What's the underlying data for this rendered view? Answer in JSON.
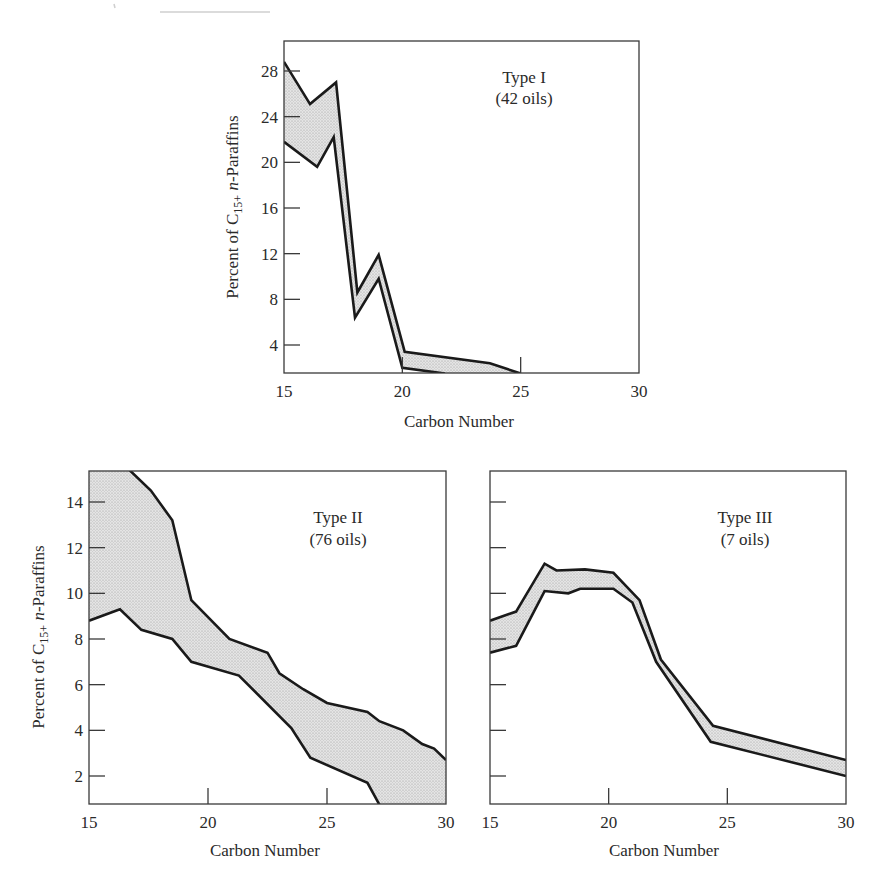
{
  "figure": {
    "panels": [
      {
        "id": "type-1",
        "type_label": "Type I",
        "count_label": "(42 oils)",
        "xlabel": "Carbon Number",
        "ylabel_prefix": "Percent of C",
        "ylabel_subscript": "15+",
        "ylabel_italic": "n",
        "ylabel_suffix": "-Paraffins",
        "x_ticks": [
          "15",
          "20",
          "25",
          "30"
        ],
        "y_ticks": [
          "4",
          "8",
          "12",
          "16",
          "20",
          "24",
          "28"
        ]
      },
      {
        "id": "type-2",
        "type_label": "Type II",
        "count_label": "(76 oils)",
        "xlabel": "Carbon Number",
        "ylabel_prefix": "Percent of C",
        "ylabel_subscript": "15+",
        "ylabel_italic": "n",
        "ylabel_suffix": "-Paraffins",
        "x_ticks": [
          "15",
          "20",
          "25",
          "30"
        ],
        "y_ticks": [
          "2",
          "4",
          "6",
          "8",
          "10",
          "12",
          "14"
        ]
      },
      {
        "id": "type-3",
        "type_label": "Type III",
        "count_label": "(7 oils)",
        "xlabel": "Carbon Number",
        "x_ticks": [
          "15",
          "20",
          "25",
          "30"
        ],
        "y_ticks": []
      }
    ]
  },
  "chart_data": [
    {
      "type": "area",
      "title": "Type I (42 oils)",
      "xlabel": "Carbon Number",
      "ylabel": "Percent of C15+ n-Paraffins",
      "xlim": [
        15,
        30
      ],
      "ylim": [
        1.5,
        30.5
      ],
      "x_ticks": [
        15,
        20,
        25,
        30
      ],
      "y_ticks": [
        4,
        8,
        12,
        16,
        20,
        24,
        28
      ],
      "grid": false,
      "series": [
        {
          "name": "upper bound",
          "x": [
            15,
            16.1,
            17.2,
            18.1,
            19.0,
            20.1,
            23.7,
            25.0
          ],
          "values": [
            28.8,
            25.1,
            27.0,
            8.6,
            11.9,
            3.4,
            2.4,
            1.5
          ]
        },
        {
          "name": "lower bound",
          "x": [
            15,
            16.4,
            17.1,
            18.0,
            19.0,
            20.0,
            21.8
          ],
          "values": [
            21.8,
            19.6,
            22.2,
            6.4,
            9.8,
            2.0,
            1.5
          ]
        }
      ],
      "annotations": [
        "Type I",
        "(42 oils)"
      ]
    },
    {
      "type": "area",
      "title": "Type II (76 oils)",
      "xlabel": "Carbon Number",
      "ylabel": "Percent of C15+ n-Paraffins",
      "xlim": [
        15,
        30
      ],
      "ylim": [
        0.75,
        15.4
      ],
      "x_ticks": [
        15,
        20,
        25,
        30
      ],
      "y_ticks": [
        2,
        4,
        6,
        8,
        10,
        12,
        14
      ],
      "grid": false,
      "series": [
        {
          "name": "upper bound",
          "x": [
            15,
            16.7,
            17.6,
            18.5,
            19.3,
            20.9,
            22.5,
            23.0,
            24.0,
            25.0,
            26.7,
            27.2,
            28.2,
            29.0,
            29.5,
            30.0
          ],
          "values": [
            15.4,
            15.4,
            14.5,
            13.2,
            9.7,
            8.0,
            7.4,
            6.5,
            5.8,
            5.2,
            4.8,
            4.4,
            4.0,
            3.4,
            3.2,
            2.7
          ]
        },
        {
          "name": "lower bound",
          "x": [
            15,
            16.3,
            17.2,
            18.5,
            19.3,
            21.3,
            23.5,
            24.3,
            26.7,
            27.2
          ],
          "values": [
            8.8,
            9.3,
            8.4,
            8.0,
            7.0,
            6.4,
            4.1,
            2.8,
            1.7,
            0.75
          ]
        }
      ],
      "annotations": [
        "Type II",
        "(76 oils)"
      ]
    },
    {
      "type": "area",
      "title": "Type III (7 oils)",
      "xlabel": "Carbon Number",
      "ylabel": "",
      "xlim": [
        15,
        30
      ],
      "ylim": [
        0.75,
        15.4
      ],
      "x_ticks": [
        15,
        20,
        25,
        30
      ],
      "y_ticks": [
        2,
        4,
        6,
        8,
        10,
        12,
        14
      ],
      "y_tick_labels_shown": false,
      "grid": false,
      "series": [
        {
          "name": "upper bound",
          "x": [
            15,
            16.1,
            17.3,
            17.8,
            19.0,
            20.2,
            21.3,
            22.2,
            24.4,
            30.0
          ],
          "values": [
            8.8,
            9.2,
            11.3,
            11.0,
            11.05,
            10.9,
            9.7,
            7.1,
            4.2,
            2.7
          ]
        },
        {
          "name": "lower bound",
          "x": [
            15,
            16.1,
            17.3,
            18.3,
            18.8,
            20.2,
            21.0,
            22.0,
            24.3,
            30.0
          ],
          "values": [
            7.4,
            7.7,
            10.1,
            10.0,
            10.2,
            10.2,
            9.6,
            7.0,
            3.5,
            2.0
          ]
        }
      ],
      "annotations": [
        "Type III",
        "(7 oils)"
      ]
    }
  ]
}
